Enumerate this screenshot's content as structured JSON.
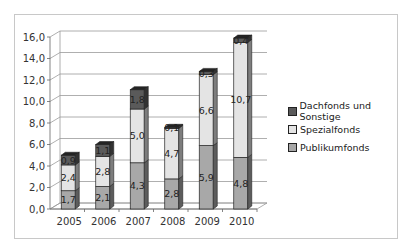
{
  "chart_data": {
    "type": "bar",
    "subtype": "stacked-3d",
    "title": "",
    "xlabel": "",
    "ylabel": "",
    "ylim": [
      0,
      16
    ],
    "yticks": [
      "0,0",
      "2,0",
      "4,0",
      "6,0",
      "8,0",
      "10,0",
      "12,0",
      "14,0",
      "16,0"
    ],
    "categories": [
      "2005",
      "2006",
      "2007",
      "2008",
      "2009",
      "2010"
    ],
    "series": [
      {
        "name": "Publikumfonds",
        "color": "#a8a8a8",
        "values": [
          1.7,
          2.1,
          4.3,
          2.8,
          5.9,
          4.8
        ],
        "labels": [
          "1,7",
          "2,1",
          "4,3",
          "2,8",
          "5,9",
          "4,8"
        ]
      },
      {
        "name": "Spezialfonds",
        "color": "#e4e4e4",
        "values": [
          2.4,
          2.8,
          5.0,
          4.7,
          6.6,
          10.7
        ],
        "labels": [
          "2,4",
          "2,8",
          "5,0",
          "4,7",
          "6,6",
          "10,7"
        ]
      },
      {
        "name": "Dachfonds und Sonstige",
        "color": "#5a5a5a",
        "values": [
          0.9,
          1.1,
          1.8,
          0.1,
          0.3,
          0.4
        ],
        "labels": [
          "0,9",
          "1,1",
          "1,8",
          "0,1",
          "0,3",
          "0,4"
        ]
      }
    ],
    "grid": true,
    "legend_position": "right"
  },
  "legend": [
    {
      "label": "Dachfonds und Sonstige",
      "color": "#5a5a5a"
    },
    {
      "label": "Spezialfonds",
      "color": "#e4e4e4"
    },
    {
      "label": "Publikumfonds",
      "color": "#a8a8a8"
    }
  ]
}
